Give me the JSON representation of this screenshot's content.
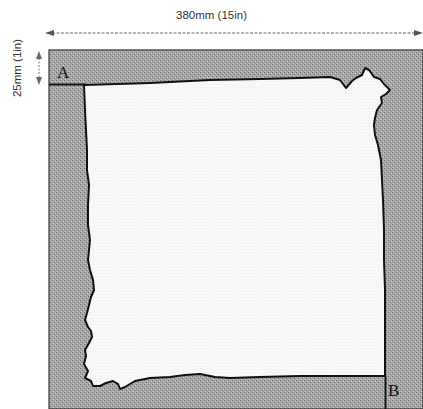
{
  "figure": {
    "width_dimension_label": "380mm (15in)",
    "height_dimension_label": "25mm (1in)",
    "corner_labels": {
      "start": "A",
      "end": "B"
    },
    "colors": {
      "border_fill": "#9a9a9a",
      "hide_fill": "#f7f7f7",
      "outline": "#111111",
      "arrow": "#666666"
    }
  }
}
